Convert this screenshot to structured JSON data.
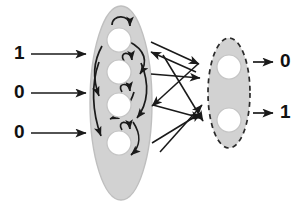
{
  "diagram": {
    "type": "recurrent-neural-network",
    "colors": {
      "reservoir_fill": "#d2d2d2",
      "reservoir_stroke": "#bdbdbd",
      "readout_fill": "#d2d2d2",
      "readout_stroke": "#2b2b2b",
      "node_fill": "#ffffff",
      "node_stroke": "#c4c4c4",
      "arrow": "#1a1a1a",
      "label": "#111111",
      "background": "#ffffff"
    },
    "inputs": {
      "name": "input-layer",
      "count": 3,
      "values": [
        "1",
        "0",
        "0"
      ],
      "arrow_name": "input-arrow"
    },
    "reservoir": {
      "name": "reservoir-ellipse",
      "node_count": 4,
      "border_style": "solid",
      "nodes": [
        "r1",
        "r2",
        "r3",
        "r4"
      ],
      "self_loops": 4,
      "recurrent_links": 6
    },
    "readout": {
      "name": "readout-ellipse",
      "node_count": 2,
      "border_style": "dashed",
      "nodes": [
        "o1",
        "o2"
      ]
    },
    "connections": {
      "name": "reservoir-to-readout",
      "count": 6,
      "style": "crossing-arrows"
    },
    "outputs": {
      "name": "output-layer",
      "count": 2,
      "values": [
        "0",
        "1"
      ],
      "arrow_name": "output-arrow"
    }
  }
}
